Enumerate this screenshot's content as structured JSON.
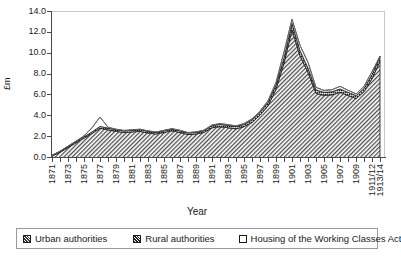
{
  "chart_data": {
    "type": "area",
    "title": "",
    "xlabel": "Year",
    "ylabel": "£m",
    "ylim": [
      0.0,
      14.0
    ],
    "yticks": [
      "0.0",
      "2.0",
      "4.0",
      "6.0",
      "8.0",
      "10.0",
      "12.0",
      "14.0"
    ],
    "grid": false,
    "stacked": true,
    "legend_position": "bottom",
    "x": [
      "1871",
      "1872",
      "1873",
      "1874",
      "1875",
      "1876",
      "1877",
      "1878",
      "1879",
      "1880",
      "1881",
      "1882",
      "1883",
      "1884",
      "1885",
      "1886",
      "1887",
      "1888",
      "1889",
      "1890",
      "1891",
      "1892",
      "1893",
      "1894",
      "1895",
      "1896",
      "1897",
      "1898",
      "1899",
      "1900",
      "1901",
      "1902",
      "1903",
      "1904",
      "1905",
      "1906",
      "1907",
      "1908",
      "1909",
      "1910",
      "1911/12",
      "1913/14"
    ],
    "xtick_labels": [
      "1871",
      "1873",
      "1875",
      "1877",
      "1879",
      "1881",
      "1883",
      "1885",
      "1887",
      "1889",
      "1891",
      "1893",
      "1895",
      "1897",
      "1899",
      "1901",
      "1903",
      "1905",
      "1907",
      "1909",
      "1911/12",
      "1913/14"
    ],
    "series": [
      {
        "name": "Urban authorities",
        "pattern": "diagonal-hatch",
        "values": [
          0.2,
          0.55,
          1.0,
          1.45,
          1.9,
          2.35,
          2.85,
          2.7,
          2.55,
          2.45,
          2.5,
          2.55,
          2.4,
          2.3,
          2.45,
          2.6,
          2.45,
          2.25,
          2.3,
          2.45,
          2.9,
          3.0,
          2.9,
          2.8,
          3.0,
          3.4,
          4.1,
          5.0,
          6.6,
          9.1,
          12.3,
          9.8,
          8.2,
          6.2,
          6.0,
          6.05,
          6.3,
          6.0,
          5.7,
          6.35,
          7.6,
          9.3
        ]
      },
      {
        "name": "Rural authorities",
        "pattern": "dense-dark",
        "values": [
          0.05,
          0.08,
          0.1,
          0.12,
          0.14,
          0.15,
          0.18,
          0.17,
          0.16,
          0.15,
          0.16,
          0.17,
          0.16,
          0.15,
          0.16,
          0.17,
          0.16,
          0.15,
          0.16,
          0.17,
          0.2,
          0.22,
          0.22,
          0.21,
          0.22,
          0.25,
          0.28,
          0.32,
          0.4,
          0.5,
          0.6,
          0.5,
          0.42,
          0.32,
          0.3,
          0.3,
          0.32,
          0.3,
          0.28,
          0.32,
          0.38,
          0.45
        ]
      },
      {
        "name": "Housing of the Working Classes Act",
        "pattern": "white",
        "values": [
          0.0,
          0.02,
          0.03,
          0.05,
          0.08,
          0.4,
          0.9,
          0.08,
          0.05,
          0.04,
          0.04,
          0.04,
          0.04,
          0.04,
          0.04,
          0.04,
          0.04,
          0.04,
          0.04,
          0.05,
          0.06,
          0.08,
          0.08,
          0.07,
          0.08,
          0.1,
          0.12,
          0.16,
          0.25,
          0.55,
          0.4,
          0.5,
          0.55,
          0.25,
          0.18,
          0.2,
          0.25,
          0.2,
          0.16,
          0.2,
          0.3,
          0.0
        ]
      }
    ],
    "totals": [
      0.25,
      0.65,
      1.13,
      1.62,
      2.12,
      2.9,
      3.93,
      2.95,
      2.76,
      2.64,
      2.7,
      2.76,
      2.6,
      2.49,
      2.65,
      2.81,
      2.65,
      2.44,
      2.5,
      2.67,
      3.16,
      3.3,
      3.2,
      3.08,
      3.3,
      3.75,
      4.5,
      5.48,
      7.25,
      10.15,
      13.3,
      10.8,
      9.17,
      6.77,
      6.48,
      6.55,
      6.87,
      6.5,
      6.14,
      6.87,
      8.28,
      9.75
    ]
  },
  "legend": {
    "items": [
      {
        "label": "Urban authorities",
        "swatch": "urban-hatch-swatch"
      },
      {
        "label": "Rural authorities",
        "swatch": "rural-dense-swatch"
      },
      {
        "label": "Housing of the Working Classes Act",
        "swatch": "act-white-swatch"
      }
    ]
  },
  "axis": {
    "y_title": "£m",
    "x_title": "Year"
  }
}
